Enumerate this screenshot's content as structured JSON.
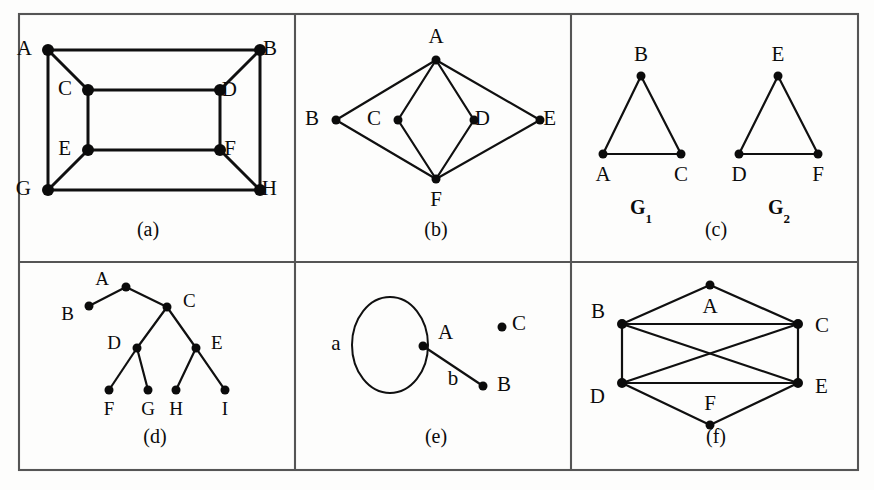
{
  "figure": {
    "background_color": "#fdfdfc",
    "ink_color": "#0b0b0b",
    "frame_color": "#555555"
  },
  "frame": {
    "x": 19,
    "y": 14,
    "width": 839,
    "height": 456,
    "v_divider_1": 295,
    "v_divider_2": 571,
    "h_divider": 262
  },
  "panels": [
    {
      "id": "a",
      "caption": "(a)",
      "caption_x": 148,
      "caption_y": 236,
      "description": "Cube-like graph with eight labeled vertices",
      "nodes": [
        {
          "id": "A",
          "label": "A",
          "x": 48,
          "y": 50,
          "r": 6.0,
          "lx": 32,
          "ly": 50
        },
        {
          "id": "B",
          "label": "B",
          "x": 260,
          "y": 50,
          "r": 6.0,
          "lx": 277,
          "ly": 50
        },
        {
          "id": "C",
          "label": "C",
          "x": 88,
          "y": 90,
          "r": 6.0,
          "lx": 72,
          "ly": 90
        },
        {
          "id": "D",
          "label": "D",
          "x": 220,
          "y": 90,
          "r": 6.0,
          "lx": 237,
          "ly": 91
        },
        {
          "id": "E",
          "label": "E",
          "x": 88,
          "y": 150,
          "r": 6.0,
          "lx": 71,
          "ly": 150
        },
        {
          "id": "F",
          "label": "F",
          "x": 220,
          "y": 150,
          "r": 6.0,
          "lx": 236,
          "ly": 150
        },
        {
          "id": "G",
          "label": "G",
          "x": 48,
          "y": 190,
          "r": 6.0,
          "lx": 31,
          "ly": 190
        },
        {
          "id": "H",
          "label": "H",
          "x": 260,
          "y": 190,
          "r": 6.0,
          "lx": 277,
          "ly": 190
        }
      ],
      "edges": [
        [
          "A",
          "B"
        ],
        [
          "A",
          "C"
        ],
        [
          "A",
          "G"
        ],
        [
          "B",
          "D"
        ],
        [
          "B",
          "H"
        ],
        [
          "C",
          "D"
        ],
        [
          "C",
          "E"
        ],
        [
          "D",
          "F"
        ],
        [
          "E",
          "F"
        ],
        [
          "E",
          "G"
        ],
        [
          "F",
          "H"
        ],
        [
          "G",
          "H"
        ]
      ]
    },
    {
      "id": "b",
      "caption": "(b)",
      "caption_x": 436,
      "caption_y": 236,
      "description": "Bipartite-like graph: A and F each joined to B, C, D, E",
      "nodes": [
        {
          "id": "A",
          "label": "A",
          "x": 436,
          "y": 60,
          "r": 4.5,
          "lx": 436,
          "ly": 38,
          "anchor": "middle"
        },
        {
          "id": "B",
          "label": "B",
          "x": 336,
          "y": 120,
          "r": 4.5,
          "lx": 319,
          "ly": 120
        },
        {
          "id": "C",
          "label": "C",
          "x": 398,
          "y": 120,
          "r": 4.5,
          "lx": 381,
          "ly": 120
        },
        {
          "id": "D",
          "label": "D",
          "x": 474,
          "y": 120,
          "r": 4.5,
          "lx": 490,
          "ly": 120
        },
        {
          "id": "E",
          "label": "E",
          "x": 540,
          "y": 120,
          "r": 4.5,
          "lx": 556,
          "ly": 120
        },
        {
          "id": "F",
          "label": "F",
          "x": 436,
          "y": 179,
          "r": 4.5,
          "lx": 436,
          "ly": 201,
          "anchor": "middle"
        }
      ],
      "edges": [
        [
          "A",
          "B"
        ],
        [
          "A",
          "C"
        ],
        [
          "A",
          "D"
        ],
        [
          "A",
          "E"
        ],
        [
          "F",
          "B"
        ],
        [
          "F",
          "C"
        ],
        [
          "F",
          "D"
        ],
        [
          "F",
          "E"
        ]
      ]
    },
    {
      "id": "c",
      "caption": "(c)",
      "caption_x": 716,
      "caption_y": 236,
      "description": "Two isomorphic triangles G1 and G2",
      "subcaptions": [
        {
          "text": "G",
          "sub": "1",
          "x": 641,
          "y": 214
        },
        {
          "text": "G",
          "sub": "2",
          "x": 779,
          "y": 214
        }
      ],
      "nodes": [
        {
          "id": "A",
          "label": "A",
          "x": 603,
          "y": 154,
          "r": 4.5,
          "lx": 603,
          "ly": 176,
          "anchor": "middle"
        },
        {
          "id": "B",
          "label": "B",
          "x": 641,
          "y": 76,
          "r": 4.5,
          "lx": 641,
          "ly": 56,
          "anchor": "middle"
        },
        {
          "id": "C",
          "label": "C",
          "x": 681,
          "y": 154,
          "r": 4.5,
          "lx": 681,
          "ly": 176,
          "anchor": "middle"
        },
        {
          "id": "D",
          "label": "D",
          "x": 739,
          "y": 154,
          "r": 4.5,
          "lx": 739,
          "ly": 176,
          "anchor": "middle"
        },
        {
          "id": "E",
          "label": "E",
          "x": 778,
          "y": 76,
          "r": 4.5,
          "lx": 778,
          "ly": 56,
          "anchor": "middle"
        },
        {
          "id": "F",
          "label": "F",
          "x": 818,
          "y": 154,
          "r": 4.5,
          "lx": 818,
          "ly": 176,
          "anchor": "middle"
        }
      ],
      "edges": [
        [
          "A",
          "B"
        ],
        [
          "B",
          "C"
        ],
        [
          "A",
          "C"
        ],
        [
          "D",
          "E"
        ],
        [
          "E",
          "F"
        ],
        [
          "D",
          "F"
        ]
      ]
    },
    {
      "id": "d",
      "caption": "(d)",
      "caption_x": 155,
      "caption_y": 443,
      "description": "Rooted tree with root A and nine vertices",
      "nodes": [
        {
          "id": "A",
          "label": "A",
          "x": 126,
          "y": 287,
          "r": 4.5,
          "lx": 109,
          "ly": 281,
          "anchor": "end"
        },
        {
          "id": "B",
          "label": "B",
          "x": 89,
          "y": 306,
          "r": 4.5,
          "lx": 74,
          "ly": 316,
          "anchor": "end"
        },
        {
          "id": "C",
          "label": "C",
          "x": 167,
          "y": 307,
          "r": 4.5,
          "lx": 183,
          "ly": 303,
          "anchor": "start"
        },
        {
          "id": "D",
          "label": "D",
          "x": 137,
          "y": 348,
          "r": 4.5,
          "lx": 121,
          "ly": 345,
          "anchor": "end"
        },
        {
          "id": "E",
          "label": "E",
          "x": 196,
          "y": 348,
          "r": 4.5,
          "lx": 211,
          "ly": 345,
          "anchor": "start"
        },
        {
          "id": "F",
          "label": "F",
          "x": 109,
          "y": 390,
          "r": 4.5,
          "lx": 109,
          "ly": 411,
          "anchor": "middle"
        },
        {
          "id": "G",
          "label": "G",
          "x": 148,
          "y": 390,
          "r": 4.5,
          "lx": 148,
          "ly": 411,
          "anchor": "middle"
        },
        {
          "id": "H",
          "label": "H",
          "x": 176,
          "y": 390,
          "r": 4.5,
          "lx": 176,
          "ly": 411,
          "anchor": "middle"
        },
        {
          "id": "I",
          "label": "I",
          "x": 225,
          "y": 390,
          "r": 4.5,
          "lx": 225,
          "ly": 411,
          "anchor": "middle"
        }
      ],
      "edges": [
        [
          "A",
          "B"
        ],
        [
          "A",
          "C"
        ],
        [
          "C",
          "D"
        ],
        [
          "C",
          "E"
        ],
        [
          "D",
          "F"
        ],
        [
          "D",
          "G"
        ],
        [
          "E",
          "H"
        ],
        [
          "E",
          "I"
        ]
      ]
    },
    {
      "id": "e",
      "caption": "(e)",
      "caption_x": 436,
      "caption_y": 443,
      "description": "Pseudograph: self-loop a at A, edge b from A to B, isolated vertex C",
      "loop": {
        "label": "a",
        "cx": 390,
        "cy": 345,
        "rx": 38,
        "ry": 48,
        "label_x": 336,
        "label_y": 345
      },
      "edge_labels": [
        {
          "text": "b",
          "x": 453,
          "y": 380
        }
      ],
      "nodes": [
        {
          "id": "A",
          "label": "A",
          "x": 423,
          "y": 346,
          "r": 4.5,
          "lx": 438,
          "ly": 334,
          "anchor": "start"
        },
        {
          "id": "B",
          "label": "B",
          "x": 483,
          "y": 386,
          "r": 4.5,
          "lx": 497,
          "ly": 386,
          "anchor": "start"
        },
        {
          "id": "C",
          "label": "C",
          "x": 502,
          "y": 327,
          "r": 4.5,
          "lx": 512,
          "ly": 325,
          "anchor": "start"
        }
      ],
      "edges": [
        [
          "A",
          "B"
        ]
      ]
    },
    {
      "id": "f",
      "caption": "(f)",
      "caption_x": 716,
      "caption_y": 443,
      "description": "Six-vertex graph with crossing diagonals",
      "nodes": [
        {
          "id": "A",
          "label": "A",
          "x": 710,
          "y": 285,
          "r": 4.5,
          "lx": 710,
          "ly": 308,
          "anchor": "middle"
        },
        {
          "id": "B",
          "label": "B",
          "x": 622,
          "y": 324,
          "r": 5.0,
          "lx": 605,
          "ly": 313,
          "anchor": "end"
        },
        {
          "id": "C",
          "label": "C",
          "x": 798,
          "y": 324,
          "r": 5.0,
          "lx": 815,
          "ly": 327,
          "anchor": "start"
        },
        {
          "id": "D",
          "label": "D",
          "x": 622,
          "y": 383,
          "r": 5.0,
          "lx": 605,
          "ly": 398,
          "anchor": "end"
        },
        {
          "id": "E",
          "label": "E",
          "x": 798,
          "y": 383,
          "r": 5.0,
          "lx": 815,
          "ly": 388,
          "anchor": "start"
        },
        {
          "id": "F",
          "label": "F",
          "x": 710,
          "y": 425,
          "r": 4.5,
          "lx": 710,
          "ly": 405,
          "anchor": "middle"
        }
      ],
      "edges": [
        [
          "A",
          "B"
        ],
        [
          "A",
          "C"
        ],
        [
          "B",
          "C"
        ],
        [
          "B",
          "D"
        ],
        [
          "B",
          "E"
        ],
        [
          "C",
          "D"
        ],
        [
          "C",
          "E"
        ],
        [
          "D",
          "E"
        ],
        [
          "D",
          "F"
        ],
        [
          "E",
          "F"
        ]
      ]
    }
  ]
}
